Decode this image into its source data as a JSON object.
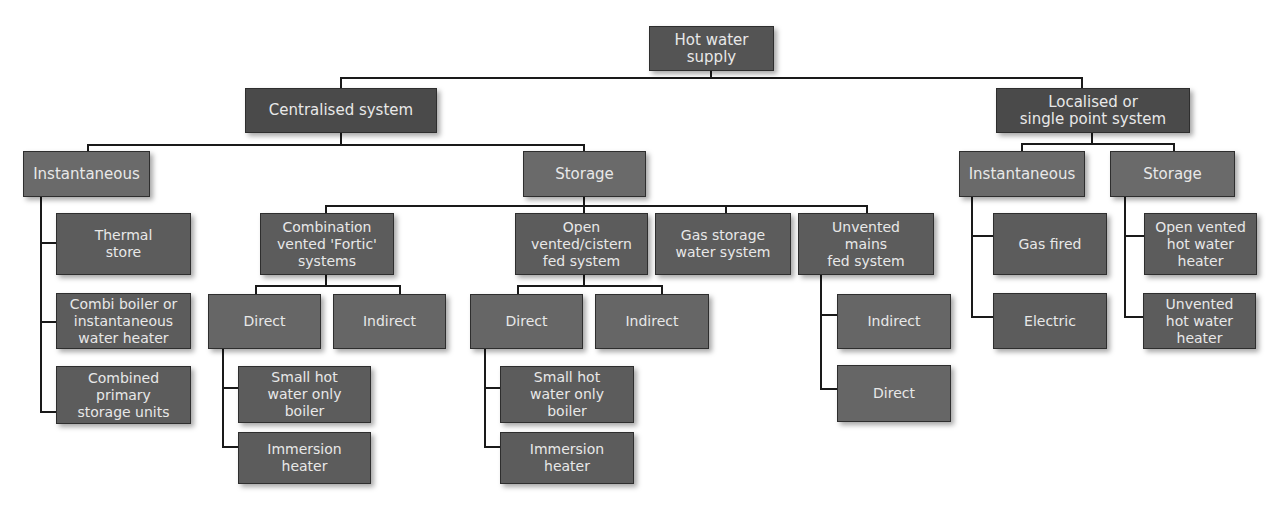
{
  "diagram": {
    "root": "Hot water\nsupply",
    "centralised": {
      "label": "Centralised system",
      "instantaneous": {
        "label": "Instantaneous",
        "children": [
          "Thermal\nstore",
          "Combi boiler or\ninstantaneous\nwater heater",
          "Combined\nprimary\nstorage units"
        ]
      },
      "storage": {
        "label": "Storage",
        "fortic": {
          "label": "Combination\nvented 'Fortic'\nsystems",
          "direct": "Direct",
          "indirect": "Indirect",
          "direct_children": [
            "Small hot\nwater only\nboiler",
            "Immersion\nheater"
          ]
        },
        "open_vented": {
          "label": "Open\nvented/cistern\nfed system",
          "direct": "Direct",
          "indirect": "Indirect",
          "direct_children": [
            "Small hot\nwater only\nboiler",
            "Immersion\nheater"
          ]
        },
        "gas_storage": {
          "label": "Gas storage\nwater system"
        },
        "unvented": {
          "label": "Unvented\nmains\nfed system",
          "children": [
            "Indirect",
            "Direct"
          ]
        }
      }
    },
    "localised": {
      "label": "Localised or\nsingle point system",
      "instantaneous": {
        "label": "Instantaneous",
        "children": [
          "Gas fired",
          "Electric"
        ]
      },
      "storage": {
        "label": "Storage",
        "children": [
          "Open vented\nhot water\nheater",
          "Unvented\nhot water\nheater"
        ]
      }
    }
  }
}
